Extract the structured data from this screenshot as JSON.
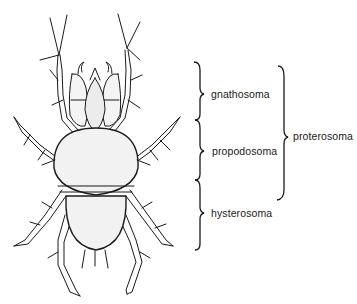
{
  "diagram": {
    "labels": {
      "gnathosoma": "gnathosoma",
      "propodosoma": "propodosoma",
      "hysterosoma": "hysterosoma",
      "proterosoma": "proterosoma"
    },
    "colors": {
      "ink": "#1a1a1a",
      "body_fill": "#f2f2f2",
      "background": "#ffffff"
    }
  }
}
